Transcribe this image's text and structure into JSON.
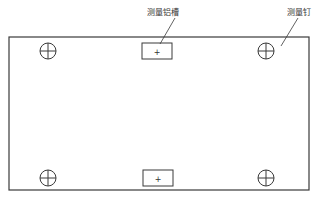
{
  "diagram": {
    "type": "plate-layout",
    "colors": {
      "stroke": "#3a3a3a",
      "background": "#ffffff",
      "text": "#333333"
    },
    "labels": {
      "slot_label": "测量铝槽",
      "pin_label": "测量钉"
    },
    "slot_marker": "+",
    "plate": {
      "x": 9,
      "y": 37,
      "width": 300,
      "height": 153
    },
    "slots": [
      {
        "id": "top-slot",
        "x": 142,
        "y": 43,
        "width": 30,
        "height": 16
      },
      {
        "id": "bottom-slot",
        "x": 143,
        "y": 170,
        "width": 30,
        "height": 16
      }
    ],
    "pins": [
      {
        "id": "top-left",
        "cx": 48,
        "cy": 51,
        "r": 8
      },
      {
        "id": "top-right",
        "cx": 266,
        "cy": 51,
        "r": 8
      },
      {
        "id": "bottom-left",
        "cx": 48,
        "cy": 178,
        "r": 8
      },
      {
        "id": "bottom-right",
        "cx": 266,
        "cy": 178,
        "r": 8
      }
    ]
  }
}
